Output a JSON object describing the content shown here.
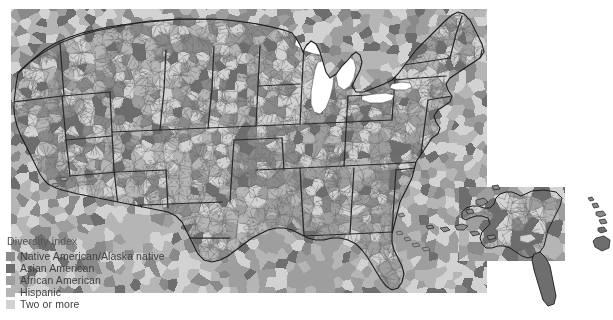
{
  "figure": {
    "name": "us-county-diversity-index-map",
    "background": "#ffffff",
    "width": 613,
    "height": 320
  },
  "legend": {
    "title": "Diversity index",
    "items": [
      {
        "label": "Native American/Alaska native",
        "color": "#8a8a8a",
        "swatch_name": "swatch-native-american"
      },
      {
        "label": "Asian American",
        "color": "#6e6e6e",
        "swatch_name": "swatch-asian-american"
      },
      {
        "label": "African American",
        "color": "#9e9e9e",
        "swatch_name": "swatch-african-american"
      },
      {
        "label": "Hispanic",
        "color": "#b5b5b5",
        "swatch_name": "swatch-hispanic"
      },
      {
        "label": "Two or more",
        "color": "#d2d2d2",
        "swatch_name": "swatch-two-or-more"
      }
    ]
  },
  "chart_data": {
    "type": "map",
    "subtype": "choropleth",
    "geography": "United States counties",
    "title": "Diversity index",
    "legend_position": "bottom-left",
    "color_scheme": "grayscale",
    "insets": [
      "Alaska",
      "Hawaii"
    ],
    "categories": [
      "Native American/Alaska native",
      "Asian American",
      "African American",
      "Hispanic",
      "Two or more"
    ],
    "category_colors": [
      "#8a8a8a",
      "#6e6e6e",
      "#9e9e9e",
      "#b5b5b5",
      "#d2d2d2"
    ],
    "water_color": "#ffffff",
    "boundary_colors": {
      "county": "#6b6b6b",
      "state": "#2b2b2b",
      "coast": "#1d1d1d"
    }
  }
}
